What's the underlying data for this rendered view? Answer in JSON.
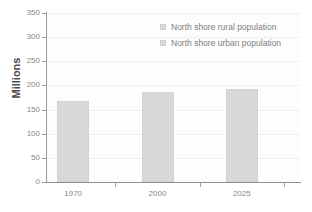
{
  "chart_data": {
    "type": "bar",
    "title": "",
    "subtitle": "",
    "xlabel": "",
    "ylabel": "Millions",
    "categories": [
      "1970",
      "2000",
      "2025"
    ],
    "values": [
      167,
      187,
      193
    ],
    "series": [
      {
        "name": "North shore urban population",
        "values": [
          167,
          187,
          193
        ]
      }
    ],
    "ylim": [
      0,
      350
    ],
    "ytick_values": [
      0,
      50,
      100,
      150,
      200,
      250,
      300,
      350
    ],
    "ytick_labels": [
      "0",
      "50",
      "100",
      "150",
      "200",
      "250",
      "300",
      "350"
    ],
    "grid": true,
    "grid_axis": "y",
    "legend_position": "top-right-inside",
    "legend": [
      {
        "label": "North shore rural population",
        "color": "#d9d9d9"
      },
      {
        "label": "North shore urban population",
        "color": "#d9d9d9"
      }
    ],
    "bar_color": "#d8d8d8",
    "plot_background": "#fdfdfd",
    "axis_color": "#8f8f8f",
    "grid_color": "#eeeeee",
    "tick_label_color": "#8a8a8a",
    "axis_title_color": "#4a4a4a"
  }
}
